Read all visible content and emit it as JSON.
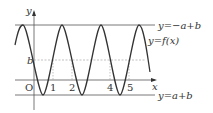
{
  "diagram": {
    "axes": {
      "x_label": "x",
      "y_label": "y",
      "origin_label": "O"
    },
    "ticks": [
      "1",
      "2",
      "4",
      "5"
    ],
    "level_label": "b",
    "lines": {
      "top": "y=−a+b",
      "bottom": "y=a+b",
      "curve": "y=f(x)"
    },
    "colors": {
      "stroke": "#333333",
      "line": "#555555",
      "dashed": "#999999"
    }
  }
}
